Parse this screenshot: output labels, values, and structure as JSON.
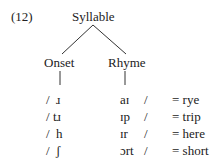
{
  "example_number": "(12)",
  "tree": {
    "root": "Syllable",
    "left": "Onset",
    "right": "Rhyme"
  },
  "rows": [
    {
      "onset_slash": "/",
      "onset": "ɹ",
      "rhyme": "aɪ",
      "rhyme_slash": "/",
      "gloss": "= rye"
    },
    {
      "onset_slash": "/",
      "onset": "tɹ",
      "rhyme": "ɪp",
      "rhyme_slash": "/",
      "gloss": "= trip"
    },
    {
      "onset_slash": "/",
      "onset": "h",
      "rhyme": "ɪr",
      "rhyme_slash": "/",
      "gloss": "= here"
    },
    {
      "onset_slash": "/",
      "onset": "ʃ",
      "rhyme": "ɔrt",
      "rhyme_slash": "/",
      "gloss": "= short"
    }
  ]
}
